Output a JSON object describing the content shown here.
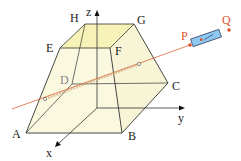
{
  "diagram": {
    "vertices": {
      "A": "A",
      "B": "B",
      "C": "C",
      "D": "D",
      "E": "E",
      "F": "F",
      "G": "G",
      "H": "H"
    },
    "axes": {
      "x": "x",
      "y": "y",
      "z": "z"
    },
    "points": {
      "P": "P",
      "Q": "Q"
    },
    "colors": {
      "top_face": "#f7f3b8",
      "solid_fill": "#fbf8e0",
      "edges": "#333333",
      "ray": "#e0623a",
      "labels_red": "#d9532b",
      "cylinder": "#8cc8f0"
    }
  }
}
